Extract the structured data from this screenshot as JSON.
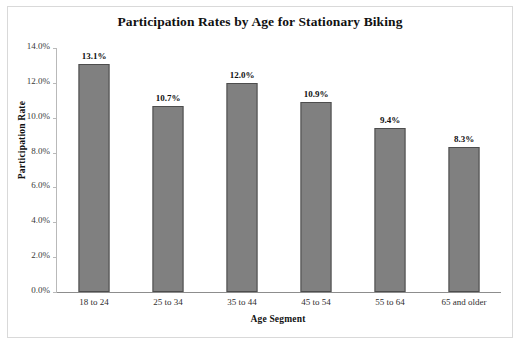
{
  "chart_data": {
    "type": "bar",
    "title": "Participation Rates by Age for Stationary Biking",
    "xlabel": "Age Segment",
    "ylabel": "Participation Rate",
    "categories": [
      "18 to 24",
      "25 to 34",
      "35 to 44",
      "45 to 54",
      "55 to 64",
      "65 and older"
    ],
    "values": [
      13.1,
      10.7,
      12.0,
      10.9,
      9.4,
      8.3
    ],
    "value_labels": [
      "13.1%",
      "10.7%",
      "12.0%",
      "10.9%",
      "9.4%",
      "8.3%"
    ],
    "ylim": [
      0.0,
      14.0
    ],
    "ytick_values": [
      0.0,
      2.0,
      4.0,
      6.0,
      8.0,
      10.0,
      12.0,
      14.0
    ],
    "ytick_labels": [
      "0.0%",
      "2.0%",
      "4.0%",
      "6.0%",
      "8.0%",
      "10.0%",
      "12.0%",
      "14.0%"
    ],
    "grid": false,
    "legend": false,
    "bar_color": "#808080",
    "bar_border_color": "#4d4d4d",
    "plot_background": "#ffffff"
  }
}
